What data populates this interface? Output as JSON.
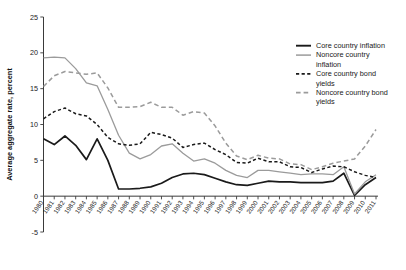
{
  "chart_data": {
    "type": "line",
    "title": "",
    "xlabel": "",
    "ylabel": "Average aggregate rate, percent",
    "ylim": [
      -5,
      25
    ],
    "yticks": [
      -5,
      0,
      5,
      10,
      15,
      20,
      25
    ],
    "grid": false,
    "legend_position": "right",
    "x": [
      1980,
      1981,
      1982,
      1983,
      1984,
      1985,
      1986,
      1987,
      1988,
      1989,
      1990,
      1991,
      1992,
      1993,
      1994,
      1995,
      1996,
      1997,
      1998,
      1999,
      2000,
      2001,
      2002,
      2003,
      2004,
      2005,
      2006,
      2007,
      2008,
      2009,
      2010,
      2011
    ],
    "xtick_labels": [
      "1980",
      "1981",
      "1982",
      "1983",
      "1984",
      "1985",
      "1986",
      "1987",
      "1988",
      "1989",
      "1990",
      "1991",
      "1992",
      "1993",
      "1994",
      "1995",
      "1996",
      "1997",
      "1998",
      "1999",
      "2000",
      "2001",
      "2002",
      "2003",
      "2004",
      "2005",
      "2006",
      "2007",
      "2008",
      "2009",
      "2010",
      "2011"
    ],
    "series": [
      {
        "name": "Core country inflation",
        "style": "solid",
        "color": "#1a1a1a",
        "width": 1.7,
        "values": [
          8.0,
          7.2,
          8.4,
          7.1,
          5.1,
          8.0,
          5.0,
          1.0,
          1.0,
          1.1,
          1.3,
          1.8,
          2.6,
          3.1,
          3.2,
          3.0,
          2.5,
          2.0,
          1.6,
          1.5,
          1.8,
          2.1,
          2.0,
          2.0,
          1.9,
          1.9,
          1.9,
          2.1,
          3.2,
          0.1,
          1.6,
          2.6
        ]
      },
      {
        "name": "Noncore country inflation",
        "style": "solid",
        "color": "#9b9b9b",
        "width": 1.3,
        "values": [
          19.3,
          19.4,
          19.3,
          17.8,
          15.8,
          15.4,
          12.1,
          8.5,
          6.0,
          5.2,
          5.8,
          7.0,
          7.3,
          6.0,
          4.9,
          5.2,
          4.6,
          3.6,
          2.9,
          2.6,
          3.6,
          3.6,
          3.4,
          3.2,
          3.0,
          3.1,
          3.1,
          3.0,
          4.1,
          0.3,
          2.0,
          3.0
        ]
      },
      {
        "name": "Core country bond yields",
        "style": "dashed-short",
        "color": "#1a1a1a",
        "width": 1.5,
        "values": [
          10.8,
          11.8,
          12.3,
          11.5,
          11.2,
          10.0,
          8.2,
          7.3,
          7.1,
          7.3,
          8.9,
          8.6,
          8.1,
          6.8,
          7.2,
          7.4,
          6.5,
          5.8,
          4.7,
          4.6,
          5.3,
          4.8,
          4.8,
          4.1,
          4.0,
          3.3,
          3.8,
          4.2,
          4.1,
          3.4,
          2.9,
          2.6
        ]
      },
      {
        "name": "Noncore country bond yields",
        "style": "dashed-long",
        "color": "#9b9b9b",
        "width": 1.5,
        "values": [
          15.3,
          16.8,
          17.4,
          17.2,
          17.0,
          17.2,
          15.1,
          12.4,
          12.4,
          12.5,
          13.1,
          12.4,
          12.4,
          11.3,
          11.8,
          11.6,
          9.8,
          7.4,
          5.6,
          5.1,
          5.7,
          5.3,
          5.2,
          4.5,
          4.4,
          3.7,
          4.1,
          4.6,
          4.9,
          5.2,
          7.0,
          9.3
        ]
      }
    ]
  },
  "legend": {
    "entries": [
      {
        "label": "Core country inflation"
      },
      {
        "label": "Noncore country",
        "label2": "inflation"
      },
      {
        "label": "Core country bond",
        "label2": "yields"
      },
      {
        "label": "Noncore country bond",
        "label2": "yields"
      }
    ]
  }
}
